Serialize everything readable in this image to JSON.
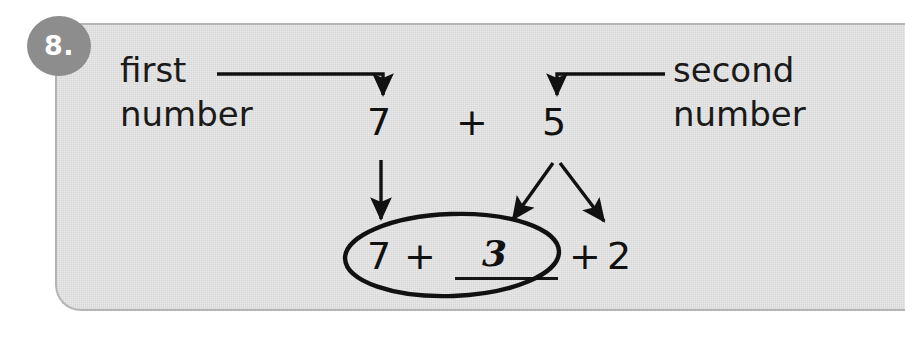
{
  "exercise": {
    "number_badge": "8.",
    "labels": {
      "first_number": "first\nnumber",
      "first_number_line1": "first",
      "first_number_line2": "number",
      "second_number_line1": "second",
      "second_number_line2": "number"
    },
    "top_expression": {
      "first_operand": "7",
      "operator": "+",
      "second_operand": "5"
    },
    "bottom_expression": {
      "first_operand": "7",
      "operator_1": "+",
      "answer_blank_value": "3",
      "operator_2": "+",
      "last_operand": "2"
    },
    "annotations": {
      "arrow_first_to_seven": "elbow-arrow",
      "arrow_second_to_five": "elbow-arrow",
      "arrow_seven_down": "straight-down-arrow",
      "arrow_five_split_left": "diagonal-arrow",
      "arrow_five_split_right": "diagonal-arrow",
      "circle_around_group": "hand-drawn-ellipse"
    }
  },
  "colors": {
    "panel_fill": "#e9e9e9",
    "panel_border": "#b4b4b4",
    "badge_fill": "#8d8d8d",
    "badge_text": "#ffffff",
    "ink": "#111111",
    "page_background": "#ffffff"
  }
}
